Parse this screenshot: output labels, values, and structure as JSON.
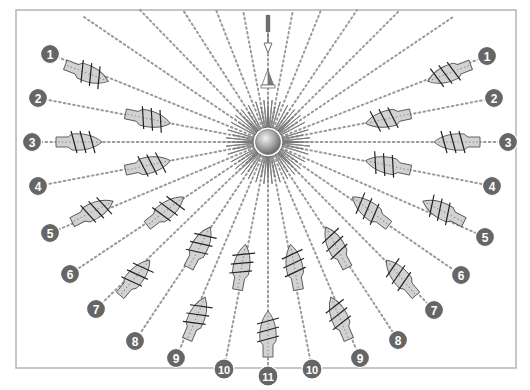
{
  "diagram": {
    "type": "points-of-sail",
    "colors": {
      "frame": "#b4b4b4",
      "ray": "#9a9a9a",
      "hull_fill": "#d2d2d2",
      "hull_stroke": "#555555",
      "badge": "#666666",
      "badge_text": "#ffffff",
      "rose_dark": "#7a7a7a",
      "rose_light": "#ffffff"
    },
    "frame": {
      "x": 16,
      "y": 10,
      "w": 500,
      "h": 358
    },
    "center": {
      "x": 268,
      "y": 142
    },
    "wind_arrow": {
      "x": 268,
      "y_top": 14,
      "y_bottom": 55,
      "label": ""
    },
    "wind_vane": {
      "x": 268,
      "y": 82
    },
    "ships": [
      {
        "side": "left",
        "number": "1",
        "badge": [
          50,
          54
        ],
        "ship": [
          84,
          72
        ],
        "angle": 21
      },
      {
        "side": "left",
        "number": "2",
        "badge": [
          38,
          98
        ],
        "ship": [
          145,
          118
        ],
        "angle": 12
      },
      {
        "side": "left",
        "number": "3",
        "badge": [
          32,
          142
        ],
        "ship": [
          76,
          142
        ],
        "angle": 0
      },
      {
        "side": "left",
        "number": "4",
        "badge": [
          38,
          186
        ],
        "ship": [
          145,
          166
        ],
        "angle": -12
      },
      {
        "side": "left",
        "number": "5",
        "badge": [
          50,
          233
        ],
        "ship": [
          90,
          213
        ],
        "angle": -27
      },
      {
        "side": "left",
        "number": "6",
        "badge": [
          70,
          274
        ],
        "ship": [
          163,
          213
        ],
        "angle": -38
      },
      {
        "side": "left",
        "number": "7",
        "badge": [
          96,
          309
        ],
        "ship": [
          133,
          280
        ],
        "angle": -50
      },
      {
        "side": "left",
        "number": "8",
        "badge": [
          135,
          341
        ],
        "ship": [
          198,
          250
        ],
        "angle": -62
      },
      {
        "side": "left",
        "number": "9",
        "badge": [
          176,
          358
        ],
        "ship": [
          195,
          321
        ],
        "angle": -67
      },
      {
        "side": "left",
        "number": "10",
        "badge": [
          224,
          369
        ],
        "ship": [
          241,
          270
        ],
        "angle": -80
      },
      {
        "side": "center",
        "number": "11",
        "badge": [
          268,
          376
        ],
        "ship": [
          268,
          337
        ],
        "angle": -90
      },
      {
        "side": "right",
        "number": "10",
        "badge": [
          312,
          369
        ],
        "ship": [
          295,
          270
        ],
        "angle": -100
      },
      {
        "side": "right",
        "number": "9",
        "badge": [
          360,
          358
        ],
        "ship": [
          341,
          321
        ],
        "angle": -113
      },
      {
        "side": "right",
        "number": "8",
        "badge": [
          398,
          340
        ],
        "ship": [
          338,
          250
        ],
        "angle": -118
      },
      {
        "side": "right",
        "number": "7",
        "badge": [
          434,
          310
        ],
        "ship": [
          403,
          280
        ],
        "angle": -130
      },
      {
        "side": "right",
        "number": "6",
        "badge": [
          461,
          275
        ],
        "ship": [
          373,
          213
        ],
        "angle": -142
      },
      {
        "side": "right",
        "number": "5",
        "badge": [
          485,
          237
        ],
        "ship": [
          446,
          213
        ],
        "angle": -153
      },
      {
        "side": "right",
        "number": "4",
        "badge": [
          492,
          186
        ],
        "ship": [
          391,
          166
        ],
        "angle": -168
      },
      {
        "side": "right",
        "number": "3",
        "badge": [
          508,
          142
        ],
        "ship": [
          460,
          142
        ],
        "angle": 180
      },
      {
        "side": "right",
        "number": "2",
        "badge": [
          494,
          98
        ],
        "ship": [
          391,
          118
        ],
        "angle": 168
      },
      {
        "side": "right",
        "number": "1",
        "badge": [
          487,
          56
        ],
        "ship": [
          452,
          72
        ],
        "angle": 159
      }
    ],
    "extra_rays": [
      [
        84,
        17
      ],
      [
        140,
        10
      ],
      [
        183,
        10
      ],
      [
        216,
        10
      ],
      [
        243,
        10
      ],
      [
        293,
        10
      ],
      [
        321,
        10
      ],
      [
        357,
        10
      ],
      [
        400,
        10
      ],
      [
        453,
        17
      ]
    ]
  }
}
